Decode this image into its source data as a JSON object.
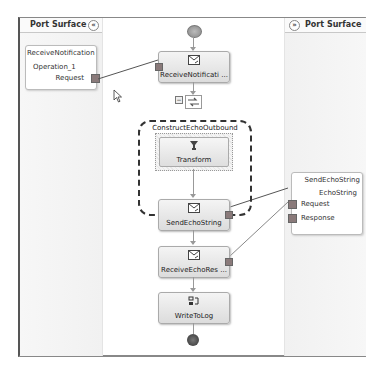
{
  "left_panel": {
    "title": "Port Surface",
    "collapse_glyph": "«",
    "port": {
      "name": "ReceiveNotification",
      "operation": "Operation_1",
      "message": "Request"
    }
  },
  "right_panel": {
    "title": "Port Surface",
    "collapse_glyph": "»",
    "port": {
      "name": "SendEchoString",
      "operation": "EchoString",
      "messages": [
        "Request",
        "Response"
      ]
    }
  },
  "orchestration": {
    "shapes": [
      {
        "label": "ReceiveNotificati ...",
        "icon": "receive-icon"
      },
      {
        "label": "Transform",
        "icon": "transform-icon"
      },
      {
        "label": "SendEchoString",
        "icon": "send-icon"
      },
      {
        "label": "ReceiveEchoRes ...",
        "icon": "receive-icon"
      },
      {
        "label": "WriteToLog",
        "icon": "expression-icon"
      }
    ],
    "construct_scope": {
      "title": "ConstructEchoOutbound",
      "collapse_glyph": "−"
    }
  },
  "colors": {
    "shape_fill_top": "#f4f4f4",
    "shape_fill_bottom": "#dcdcdc",
    "handle": "#8a7a7a",
    "connector": "#555555"
  }
}
